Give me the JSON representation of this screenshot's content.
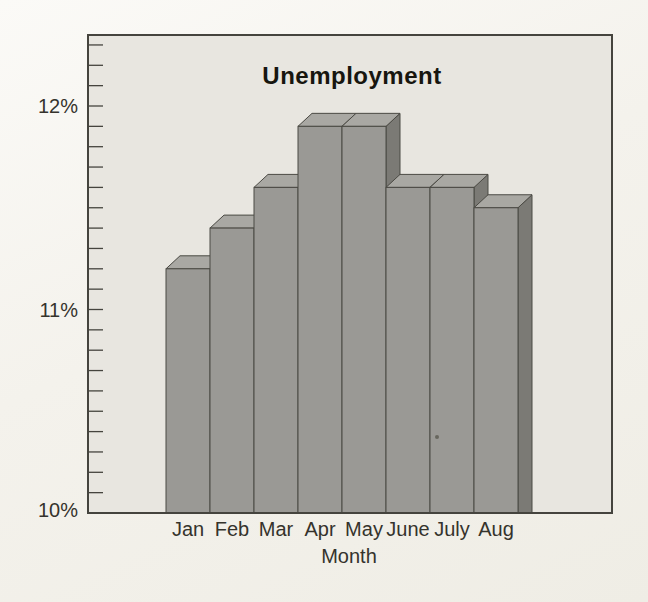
{
  "chart_data": {
    "type": "bar",
    "title": "Unemployment",
    "xlabel": "Month",
    "ylabel": "",
    "categories": [
      "Jan",
      "Feb",
      "Mar",
      "Apr",
      "May",
      "June",
      "July",
      "Aug"
    ],
    "values": [
      11.2,
      11.4,
      11.6,
      11.9,
      11.9,
      11.6,
      11.6,
      11.5
    ],
    "unit": "%",
    "ylim": [
      10,
      12.35
    ],
    "yticks": [
      10,
      11,
      12
    ],
    "ytick_labels": [
      "10%",
      "11%",
      "12%"
    ],
    "minor_tick_step": 0.1,
    "minor_tick_max": 12.3,
    "grid": false,
    "legend": false,
    "bar_style": "3d-blocks"
  },
  "colors": {
    "page_bg": "#f4f2ec",
    "plot_bg": "#e8e6e0",
    "bar_front": "#9a9995",
    "bar_top": "#a9a8a3",
    "bar_side": "#7b7a75",
    "outline": "#4b4a44",
    "axis": "#45443e",
    "text": "#35332c",
    "title_text": "#17160f"
  }
}
